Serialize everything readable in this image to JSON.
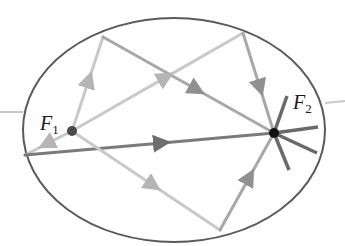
{
  "diagram": {
    "colors": {
      "ellipse": "#5a5a5a",
      "axis": "#c8c8c8",
      "ray_light": "#c9c9c9",
      "ray_mid": "#a8a8a8",
      "ray_dark": "#7a7a7a",
      "spoke": "#6a6a6a",
      "focus1": "#4a4a4a",
      "focus2": "#111111"
    },
    "ellipse": {
      "cx": 174,
      "cy": 130,
      "rx": 151,
      "ry": 112
    },
    "foci": [
      {
        "id": "F1",
        "label": "F",
        "subscript": "1",
        "x": 72,
        "y": 131,
        "label_x": 40,
        "label_y": 113
      },
      {
        "id": "F2",
        "label": "F",
        "subscript": "2",
        "x": 274,
        "y": 133,
        "label_x": 293,
        "label_y": 92
      }
    ],
    "rays": [
      {
        "from": [
          72,
          131
        ],
        "to": [
          103,
          37
        ],
        "shade": "ray_light"
      },
      {
        "from": [
          103,
          37
        ],
        "to": [
          274,
          133
        ],
        "shade": "ray_mid"
      },
      {
        "from": [
          72,
          131
        ],
        "to": [
          243,
          33
        ],
        "shade": "ray_light"
      },
      {
        "from": [
          243,
          33
        ],
        "to": [
          274,
          133
        ],
        "shade": "ray_mid"
      },
      {
        "from": [
          72,
          131
        ],
        "to": [
          25,
          155
        ],
        "shade": "ray_light"
      },
      {
        "from": [
          25,
          155
        ],
        "to": [
          274,
          133
        ],
        "shade": "ray_dark"
      },
      {
        "from": [
          72,
          131
        ],
        "to": [
          220,
          230
        ],
        "shade": "ray_light"
      },
      {
        "from": [
          220,
          230
        ],
        "to": [
          274,
          133
        ],
        "shade": "ray_mid"
      }
    ],
    "spokes": [
      {
        "to": [
          318,
          127
        ]
      },
      {
        "to": [
          317,
          153
        ]
      },
      {
        "to": [
          289,
          170
        ]
      },
      {
        "to": [
          287,
          96
        ]
      }
    ],
    "axis_stubs": [
      {
        "from": [
          0,
          112
        ],
        "to": [
          23,
          112
        ]
      },
      {
        "from": [
          325,
          103
        ],
        "to": [
          345,
          101
        ]
      }
    ]
  }
}
